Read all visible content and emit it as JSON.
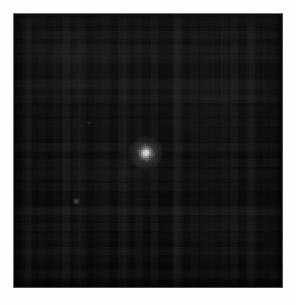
{
  "figure": {
    "kind": "astronomical-image",
    "title": "",
    "width_px": 296,
    "height_px": 305,
    "background_color": "#fefefe"
  },
  "panel": {
    "left_px": 13,
    "top_px": 13,
    "width_px": 270,
    "height_px": 275,
    "sky_color": "#070707",
    "border_color_light": "#6e6e6e",
    "border_color_dark": "#4a4a4a",
    "colormap": "grayscale-linear",
    "noise_character": "blocky 8x8 compression noise"
  },
  "chart_data": {
    "type": "heatmap",
    "title": "",
    "subtitle": "",
    "xlabel": "",
    "ylabel": "",
    "grid": false,
    "legend": "none",
    "colormap": "grayscale",
    "value_range": [
      0,
      255
    ],
    "background_level": 8,
    "axis_ticks_visible": false,
    "tick_labels_x": [],
    "tick_labels_y": [],
    "annotations": [],
    "sources": [
      {
        "name": "primary-point-source",
        "x_px": 145,
        "y_px": 152,
        "peak_brightness": 216,
        "fwhm_px": 8,
        "halo_diameter_px": 34,
        "core_diameter_px": 18,
        "morphology": "pixelated-psf",
        "label": ""
      },
      {
        "name": "faint-source-lower-left",
        "x_px": 75,
        "y_px": 200,
        "peak_brightness": 70,
        "fwhm_px": 3,
        "morphology": "point",
        "label": ""
      },
      {
        "name": "faint-source-upper-left",
        "x_px": 88,
        "y_px": 122,
        "peak_brightness": 42,
        "fwhm_px": 2,
        "morphology": "point",
        "label": ""
      }
    ],
    "streaks": [
      {
        "name": "readout-streak",
        "y_px": 198,
        "brightness": 18
      }
    ]
  }
}
